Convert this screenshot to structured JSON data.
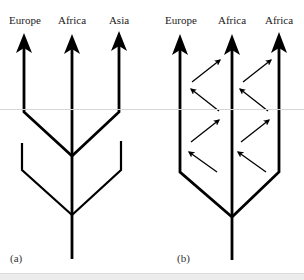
{
  "panel_a": {
    "panel_label": "(a)",
    "lineages": [
      {
        "label": "Europe"
      },
      {
        "label": "Africa"
      },
      {
        "label": "Asia"
      }
    ]
  },
  "panel_b": {
    "panel_label": "(b)",
    "lineages": [
      {
        "label": "Europe"
      },
      {
        "label": "Africa"
      },
      {
        "label": "Africa"
      }
    ]
  },
  "colors": {
    "stroke": "#000000",
    "background": "#ffffff"
  }
}
